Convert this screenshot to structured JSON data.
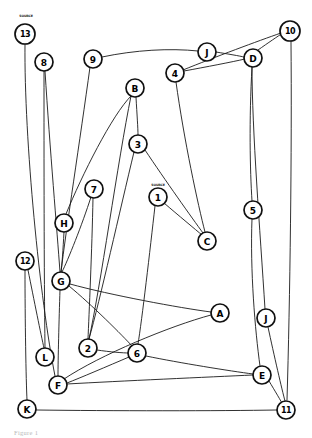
{
  "figure": {
    "caption": "Figure 1",
    "background_color": "#ffffff",
    "ink_color": "#111111",
    "edge_color": "#1a1a1a"
  },
  "annotations": [
    {
      "id": "anno-13",
      "text": "SOURCE",
      "x": 26,
      "y": 17
    },
    {
      "id": "anno-1",
      "text": "SOURCE",
      "x": 158,
      "y": 186
    }
  ],
  "chart_data": {
    "type": "diagram",
    "node_count": 25,
    "edge_count": 35,
    "nodes": [
      {
        "id": "13",
        "label": "13",
        "x": 25,
        "y": 34,
        "r": 10
      },
      {
        "id": "8",
        "label": "8",
        "x": 44,
        "y": 62,
        "r": 9
      },
      {
        "id": "9",
        "label": "9",
        "x": 93,
        "y": 59,
        "r": 9
      },
      {
        "id": "J2",
        "label": "J",
        "x": 207,
        "y": 52,
        "r": 9
      },
      {
        "id": "D",
        "label": "D",
        "x": 253,
        "y": 58,
        "r": 9
      },
      {
        "id": "10",
        "label": "10",
        "x": 290,
        "y": 31,
        "r": 10
      },
      {
        "id": "4",
        "label": "4",
        "x": 175,
        "y": 73,
        "r": 9
      },
      {
        "id": "B",
        "label": "B",
        "x": 135,
        "y": 88,
        "r": 9
      },
      {
        "id": "3",
        "label": "3",
        "x": 138,
        "y": 144,
        "r": 9
      },
      {
        "id": "1",
        "label": "1",
        "x": 158,
        "y": 197,
        "r": 9
      },
      {
        "id": "5",
        "label": "5",
        "x": 253,
        "y": 210,
        "r": 9
      },
      {
        "id": "7",
        "label": "7",
        "x": 94,
        "y": 189,
        "r": 9
      },
      {
        "id": "H",
        "label": "H",
        "x": 64,
        "y": 223,
        "r": 9
      },
      {
        "id": "C",
        "label": "C",
        "x": 207,
        "y": 241,
        "r": 9
      },
      {
        "id": "12",
        "label": "12",
        "x": 25,
        "y": 261,
        "r": 9
      },
      {
        "id": "G",
        "label": "G",
        "x": 61,
        "y": 281,
        "r": 9
      },
      {
        "id": "A",
        "label": "A",
        "x": 220,
        "y": 313,
        "r": 9
      },
      {
        "id": "J",
        "label": "J",
        "x": 266,
        "y": 318,
        "r": 9
      },
      {
        "id": "L",
        "label": "L",
        "x": 45,
        "y": 357,
        "r": 9
      },
      {
        "id": "2",
        "label": "2",
        "x": 88,
        "y": 348,
        "r": 9
      },
      {
        "id": "6",
        "label": "6",
        "x": 137,
        "y": 353,
        "r": 9
      },
      {
        "id": "E",
        "label": "E",
        "x": 262,
        "y": 375,
        "r": 9
      },
      {
        "id": "F",
        "label": "F",
        "x": 58,
        "y": 385,
        "r": 9
      },
      {
        "id": "K",
        "label": "K",
        "x": 27,
        "y": 409,
        "r": 9
      },
      {
        "id": "11",
        "label": "11",
        "x": 286,
        "y": 410,
        "r": 9
      }
    ],
    "edges": [
      {
        "from": "13",
        "to": "F",
        "path": "M25,44 C24,140 40,300 55,376"
      },
      {
        "from": "8",
        "to": "L",
        "path": "M44,71 C44,160 44,270 45,348"
      },
      {
        "from": "8",
        "to": "G",
        "path": "M45,71 C50,150 57,230 60,272"
      },
      {
        "from": "9",
        "to": "G",
        "path": "M90,67 C80,140 66,230 61,272"
      },
      {
        "from": "9",
        "to": "J2",
        "path": "M102,57 C135,50 170,48 198,51"
      },
      {
        "from": "J2",
        "to": "D",
        "path": "M216,52 C228,54 240,56 244,57"
      },
      {
        "from": "D",
        "to": "10",
        "path": "M258,50 C268,43 278,36 283,33"
      },
      {
        "from": "4",
        "to": "10",
        "path": "M183,70 C215,57 258,41 281,33"
      },
      {
        "from": "4",
        "to": "D",
        "path": "M184,71 C206,67 232,62 245,59"
      },
      {
        "from": "10",
        "to": "11",
        "path": "M291,41 C292,150 290,300 287,400"
      },
      {
        "from": "D",
        "to": "5",
        "path": "M252,67 C249,120 250,170 252,201"
      },
      {
        "from": "5",
        "to": "E",
        "path": "M252,219 C250,270 255,330 260,366"
      },
      {
        "from": "B",
        "to": "3",
        "path": "M136,97 C137,115 138,128 138,135"
      },
      {
        "from": "B",
        "to": "2",
        "path": "M131,96 C118,160 100,290 89,339"
      },
      {
        "from": "3",
        "to": "C",
        "path": "M145,150 C165,180 192,218 203,233"
      },
      {
        "from": "3",
        "to": "2",
        "path": "M134,152 C120,210 100,300 89,339"
      },
      {
        "from": "1",
        "to": "C",
        "path": "M164,203 C178,215 196,230 202,235"
      },
      {
        "from": "1",
        "to": "6",
        "path": "M155,206 C150,250 142,320 138,344"
      },
      {
        "from": "4",
        "to": "C",
        "path": "M176,82 C184,140 198,205 205,232"
      },
      {
        "from": "7",
        "to": "G",
        "path": "M91,197 C82,225 68,260 62,272"
      },
      {
        "from": "7",
        "to": "2",
        "path": "M93,198 C92,250 89,315 88,339"
      },
      {
        "from": "H",
        "to": "B",
        "path": "M66,214 C82,175 112,115 131,96"
      },
      {
        "from": "H",
        "to": "G",
        "path": "M64,232 C63,250 62,265 61,272"
      },
      {
        "from": "12",
        "to": "L",
        "path": "M28,270 C34,300 41,335 44,348"
      },
      {
        "from": "12",
        "to": "K",
        "path": "M25,270 C25,320 26,380 27,400"
      },
      {
        "from": "G",
        "to": "F",
        "path": "M60,290 C59,320 58,360 58,376"
      },
      {
        "from": "G",
        "to": "6",
        "path": "M69,286 C92,305 122,335 133,347"
      },
      {
        "from": "G",
        "to": "A",
        "path": "M70,284 C110,295 180,308 211,312"
      },
      {
        "from": "2",
        "to": "6",
        "path": "M97,350 C110,352 124,353 128,353"
      },
      {
        "from": "6",
        "to": "F",
        "path": "M129,357 C108,366 80,378 67,383"
      },
      {
        "from": "6",
        "to": "E",
        "path": "M146,356 C180,363 230,371 253,374"
      },
      {
        "from": "F",
        "to": "E",
        "path": "M67,384 C120,381 210,377 253,375"
      },
      {
        "from": "F",
        "to": "A",
        "path": "M64,379 C100,355 170,326 211,315"
      },
      {
        "from": "E",
        "to": "11",
        "path": "M269,381 C275,391 281,401 283,405"
      },
      {
        "from": "J",
        "to": "11",
        "path": "M268,327 C274,355 282,390 285,401"
      },
      {
        "from": "J",
        "to": "D",
        "path": "M265,309 C260,230 252,130 252,67"
      },
      {
        "from": "K",
        "to": "11",
        "path": "M36,410 C110,411 220,411 277,410"
      }
    ]
  }
}
